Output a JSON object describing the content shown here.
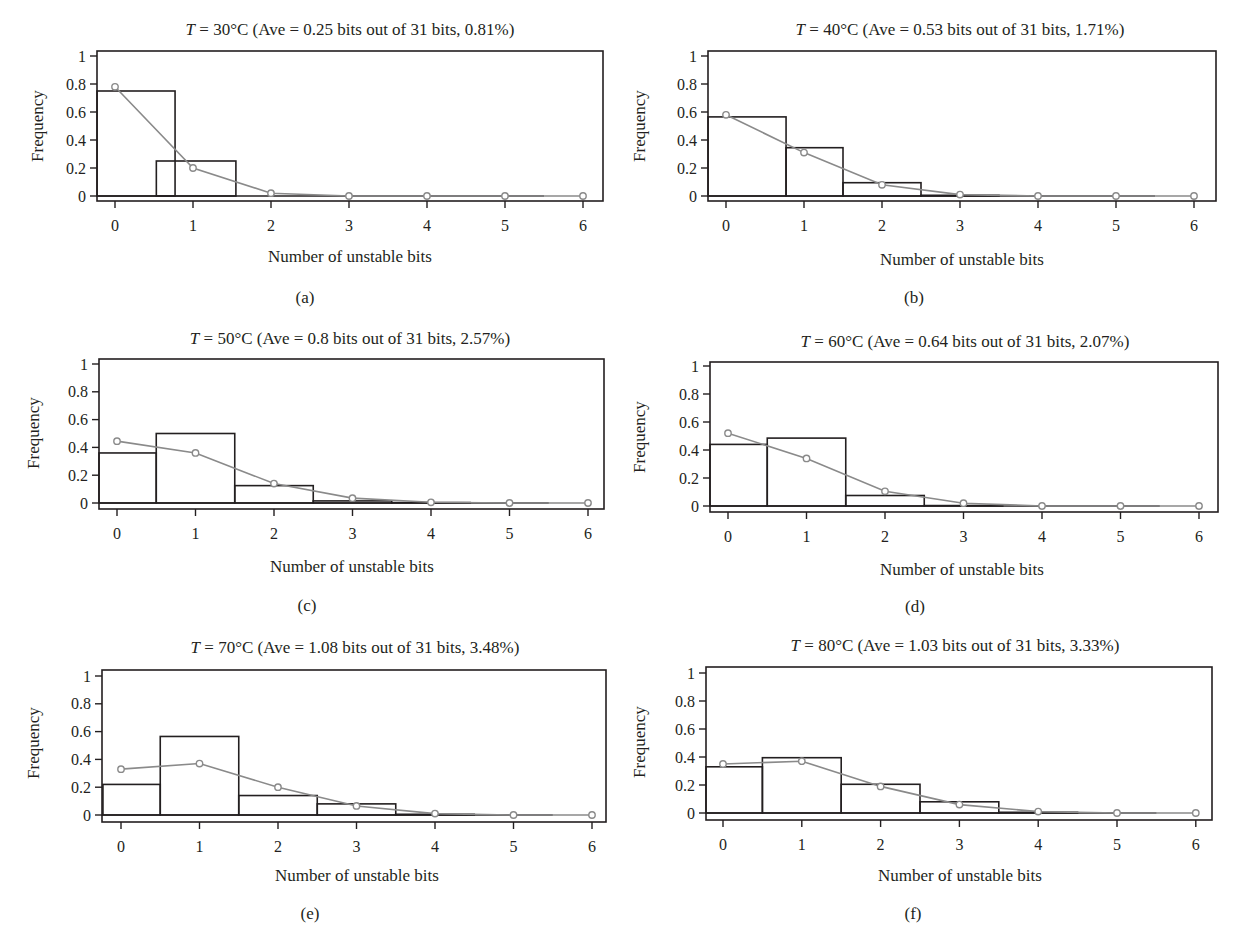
{
  "figure": {
    "x_axis_label": "Number of unstable bits",
    "y_axis_label": "Frequency",
    "x_ticks": [
      "0",
      "1",
      "2",
      "3",
      "4",
      "5",
      "6"
    ],
    "y_ticks": [
      "0",
      "0.2",
      "0.4",
      "0.6",
      "0.8",
      "1"
    ],
    "colors": {
      "frame": "#231f20",
      "bars": "#231f20",
      "fit_line": "#8a8a8a",
      "markers": "#8a8a8a",
      "background": "#ffffff"
    }
  },
  "panels": [
    {
      "id": "a",
      "title_T": "T",
      "title_rest": " = 30°C (Ave = 0.25 bits out of 31 bits, 0.81%)",
      "sublabel": "(a)"
    },
    {
      "id": "b",
      "title_T": "T",
      "title_rest": " = 40°C (Ave = 0.53 bits out of 31 bits, 1.71%)",
      "sublabel": "(b)"
    },
    {
      "id": "c",
      "title_T": "T",
      "title_rest": " = 50°C (Ave = 0.8 bits out of 31 bits, 2.57%)",
      "sublabel": "(c)"
    },
    {
      "id": "d",
      "title_T": "T",
      "title_rest": " = 60°C (Ave = 0.64 bits out of 31 bits, 2.07%)",
      "sublabel": "(d)"
    },
    {
      "id": "e",
      "title_T": "T",
      "title_rest": " = 70°C (Ave = 1.08 bits out of 31 bits, 3.48%)",
      "sublabel": "(e)"
    },
    {
      "id": "f",
      "title_T": "T",
      "title_rest": " = 80°C (Ave = 1.03 bits out of 31 bits, 3.33%)",
      "sublabel": "(f)"
    }
  ],
  "chart_data": [
    {
      "type": "bar",
      "panel": "a",
      "title": "T = 30°C (Ave = 0.25 bits out of 31 bits, 0.81%)",
      "xlabel": "Number of unstable bits",
      "ylabel": "Frequency",
      "categories": [
        0,
        1,
        2,
        3,
        4,
        5,
        6
      ],
      "xlim": [
        -0.23,
        6.25
      ],
      "ylim": [
        0,
        1
      ],
      "grid": false,
      "series": [
        {
          "name": "Observed frequency (histogram)",
          "type": "bar",
          "bars": [
            {
              "x0": -0.23,
              "x1": 0.77,
              "value": 0.75
            },
            {
              "x0": 0.53,
              "x1": 1.55,
              "value": 0.25
            }
          ]
        },
        {
          "name": "Fitted distribution",
          "type": "line",
          "values": [
            0.78,
            0.2,
            0.02,
            0.0,
            0.0,
            0.0,
            0.0
          ]
        }
      ]
    },
    {
      "type": "bar",
      "panel": "b",
      "title": "T = 40°C (Ave = 0.53 bits out of 31 bits, 1.71%)",
      "xlabel": "Number of unstable bits",
      "ylabel": "Frequency",
      "categories": [
        0,
        1,
        2,
        3,
        4,
        5,
        6
      ],
      "xlim": [
        -0.23,
        6.25
      ],
      "ylim": [
        0,
        1
      ],
      "grid": false,
      "series": [
        {
          "name": "Observed frequency (histogram)",
          "type": "bar",
          "bars": [
            {
              "x0": -0.23,
              "x1": 0.77,
              "value": 0.565
            },
            {
              "x0": 0.77,
              "x1": 1.5,
              "value": 0.345
            },
            {
              "x0": 1.5,
              "x1": 2.5,
              "value": 0.095
            },
            {
              "x0": 2.5,
              "x1": 3.5,
              "value": 0.005
            }
          ]
        },
        {
          "name": "Fitted distribution",
          "type": "line",
          "values": [
            0.58,
            0.31,
            0.08,
            0.01,
            0.0,
            0.0,
            0.0
          ]
        }
      ]
    },
    {
      "type": "bar",
      "panel": "c",
      "title": "T = 50°C (Ave = 0.8 bits out of 31 bits, 2.57%)",
      "xlabel": "Number of unstable bits",
      "ylabel": "Frequency",
      "categories": [
        0,
        1,
        2,
        3,
        4,
        5,
        6
      ],
      "xlim": [
        -0.23,
        6.25
      ],
      "ylim": [
        0,
        1
      ],
      "grid": false,
      "series": [
        {
          "name": "Observed frequency (histogram)",
          "type": "bar",
          "bars": [
            {
              "x0": -0.23,
              "x1": 0.5,
              "value": 0.36
            },
            {
              "x0": 0.5,
              "x1": 1.5,
              "value": 0.5
            },
            {
              "x0": 1.5,
              "x1": 2.5,
              "value": 0.125
            },
            {
              "x0": 2.5,
              "x1": 3.5,
              "value": 0.015
            },
            {
              "x0": 3.5,
              "x1": 4.5,
              "value": 0.003
            }
          ]
        },
        {
          "name": "Fitted distribution",
          "type": "line",
          "values": [
            0.445,
            0.36,
            0.14,
            0.035,
            0.005,
            0.0,
            0.0
          ]
        }
      ]
    },
    {
      "type": "bar",
      "panel": "d",
      "title": "T = 60°C (Ave = 0.64 bits out of 31 bits, 2.07%)",
      "xlabel": "Number of unstable bits",
      "ylabel": "Frequency",
      "categories": [
        0,
        1,
        2,
        3,
        4,
        5,
        6
      ],
      "xlim": [
        -0.23,
        6.25
      ],
      "ylim": [
        0,
        1
      ],
      "grid": false,
      "series": [
        {
          "name": "Observed frequency (histogram)",
          "type": "bar",
          "bars": [
            {
              "x0": -0.23,
              "x1": 0.5,
              "value": 0.44
            },
            {
              "x0": 0.5,
              "x1": 1.5,
              "value": 0.485
            },
            {
              "x0": 1.5,
              "x1": 2.5,
              "value": 0.075
            },
            {
              "x0": 2.5,
              "x1": 3.5,
              "value": 0.003
            }
          ]
        },
        {
          "name": "Fitted distribution",
          "type": "line",
          "values": [
            0.52,
            0.34,
            0.105,
            0.02,
            0.0,
            0.0,
            0.0
          ]
        }
      ]
    },
    {
      "type": "bar",
      "panel": "e",
      "title": "T = 70°C (Ave = 1.08 bits out of 31 bits, 3.48%)",
      "xlabel": "Number of unstable bits",
      "ylabel": "Frequency",
      "categories": [
        0,
        1,
        2,
        3,
        4,
        5,
        6
      ],
      "xlim": [
        -0.23,
        6.25
      ],
      "ylim": [
        0,
        1
      ],
      "grid": false,
      "series": [
        {
          "name": "Observed frequency (histogram)",
          "type": "bar",
          "bars": [
            {
              "x0": -0.23,
              "x1": 0.5,
              "value": 0.22
            },
            {
              "x0": 0.5,
              "x1": 1.5,
              "value": 0.565
            },
            {
              "x0": 1.5,
              "x1": 2.5,
              "value": 0.14
            },
            {
              "x0": 2.5,
              "x1": 3.5,
              "value": 0.08
            },
            {
              "x0": 3.5,
              "x1": 4.5,
              "value": 0.005
            }
          ]
        },
        {
          "name": "Fitted distribution",
          "type": "line",
          "values": [
            0.33,
            0.37,
            0.2,
            0.065,
            0.01,
            0.0,
            0.0
          ]
        }
      ]
    },
    {
      "type": "bar",
      "panel": "f",
      "title": "T = 80°C (Ave = 1.03 bits out of 31 bits, 3.33%)",
      "xlabel": "Number of unstable bits",
      "ylabel": "Frequency",
      "categories": [
        0,
        1,
        2,
        3,
        4,
        5,
        6
      ],
      "xlim": [
        -0.23,
        6.25
      ],
      "ylim": [
        0,
        1
      ],
      "grid": false,
      "series": [
        {
          "name": "Observed frequency (histogram)",
          "type": "bar",
          "bars": [
            {
              "x0": -0.23,
              "x1": 0.5,
              "value": 0.33
            },
            {
              "x0": 0.5,
              "x1": 1.5,
              "value": 0.395
            },
            {
              "x0": 1.5,
              "x1": 2.5,
              "value": 0.205
            },
            {
              "x0": 2.5,
              "x1": 3.5,
              "value": 0.08
            },
            {
              "x0": 3.5,
              "x1": 4.5,
              "value": 0.005
            }
          ]
        },
        {
          "name": "Fitted distribution",
          "type": "line",
          "values": [
            0.35,
            0.37,
            0.19,
            0.06,
            0.01,
            0.0,
            0.0
          ]
        }
      ]
    }
  ]
}
